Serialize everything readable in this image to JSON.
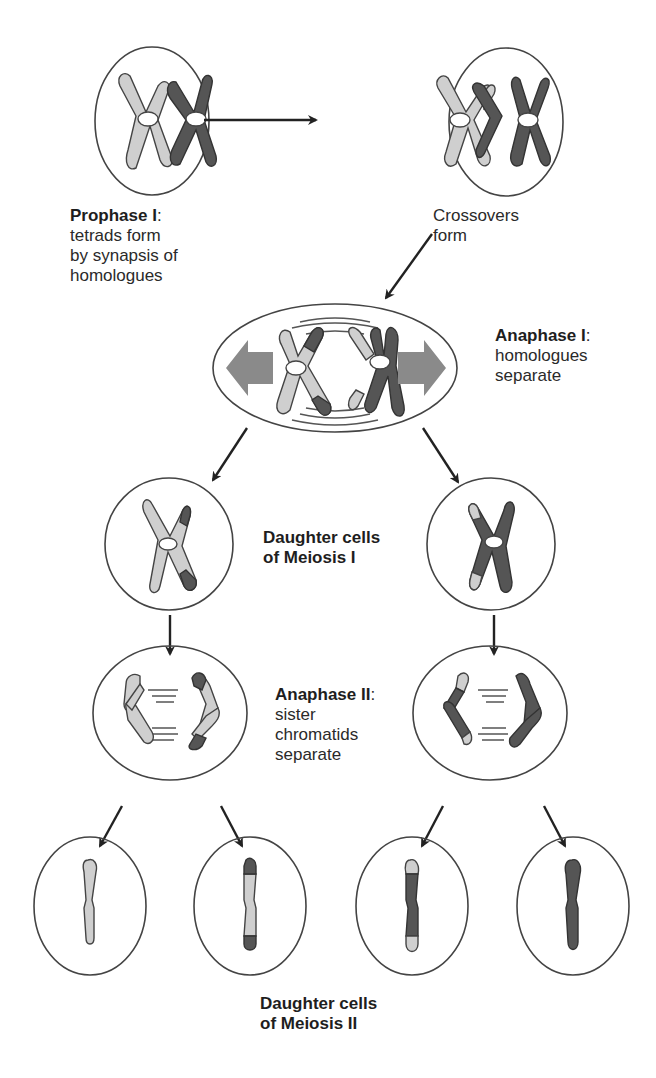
{
  "diagram": {
    "colors": {
      "background": "#ffffff",
      "light_chromosome": "#cfcfcf",
      "dark_chromosome": "#555555",
      "outline": "#444444",
      "movement_arrow": "#8a8a8a"
    },
    "labels": {
      "prophase": {
        "title": "Prophase I",
        "suffix": ":",
        "line1": "tetrads form",
        "line2": "by synapsis of",
        "line3": "homologues"
      },
      "crossovers": {
        "line1": "Crossovers",
        "line2": "form"
      },
      "anaphase1": {
        "title": "Anaphase I",
        "suffix": ":",
        "line1": "homologues",
        "line2": "separate"
      },
      "daughter1": {
        "line1": "Daughter cells",
        "line2": "of Meiosis I"
      },
      "anaphase2": {
        "title": "Anaphase II",
        "suffix": ":",
        "line1": "sister",
        "line2": "chromatids",
        "line3": "separate"
      },
      "daughter2": {
        "line1": "Daughter cells",
        "line2": "of Meiosis II"
      }
    },
    "stages": [
      {
        "id": "prophase-cell",
        "shape": "circle"
      },
      {
        "id": "crossover-cell",
        "shape": "circle"
      },
      {
        "id": "anaphase1-cell",
        "shape": "ellipse"
      },
      {
        "id": "meiosis1-daughter-left",
        "shape": "circle"
      },
      {
        "id": "meiosis1-daughter-right",
        "shape": "circle"
      },
      {
        "id": "anaphase2-left",
        "shape": "ellipse"
      },
      {
        "id": "anaphase2-right",
        "shape": "ellipse"
      },
      {
        "id": "meiosis2-daughter-1",
        "shape": "circle"
      },
      {
        "id": "meiosis2-daughter-2",
        "shape": "circle"
      },
      {
        "id": "meiosis2-daughter-3",
        "shape": "circle"
      },
      {
        "id": "meiosis2-daughter-4",
        "shape": "circle"
      }
    ]
  }
}
